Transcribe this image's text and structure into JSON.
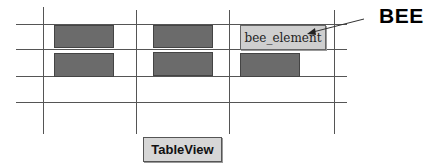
{
  "diagram": {
    "annotation_label": "BEE",
    "highlighted_element_label": "bee_element",
    "view_label": "TableView",
    "colors": {
      "grid_line": "#555555",
      "cell_fill": "#6b6b6b",
      "highlight_fill": "#cfcfcf",
      "view_fill": "#d6d6d6",
      "text": "#000000"
    },
    "grid": {
      "rows": 3,
      "columns": 3,
      "cells": [
        [
          "filled",
          "filled",
          "bee_element"
        ],
        [
          "filled",
          "filled",
          "filled"
        ],
        [
          "empty",
          "empty",
          "empty"
        ]
      ]
    }
  }
}
